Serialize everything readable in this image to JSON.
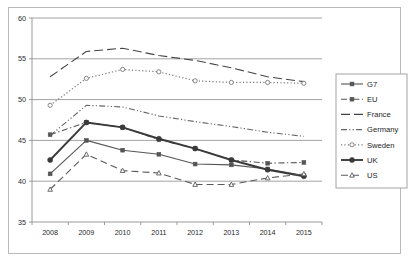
{
  "chart_data": {
    "type": "line",
    "title": "",
    "xlabel": "",
    "ylabel": "",
    "categories": [
      "2008",
      "2009",
      "2010",
      "2011",
      "2012",
      "2013",
      "2014",
      "2015"
    ],
    "x": [
      2008,
      2009,
      2010,
      2011,
      2012,
      2013,
      2014,
      2015
    ],
    "ylim": [
      35,
      60
    ],
    "yticks": [
      35,
      40,
      45,
      50,
      55,
      60
    ],
    "grid": "horizontal",
    "legend_position": "right",
    "series": [
      {
        "name": "G7",
        "marker": "square",
        "line": "solid",
        "color": "#555555",
        "values": [
          40.9,
          45.0,
          43.8,
          43.3,
          42.1,
          42.0,
          41.5,
          40.7
        ]
      },
      {
        "name": "EU",
        "marker": "square",
        "line": "dash-dot",
        "color": "#555555",
        "values": [
          45.7,
          47.2,
          46.6,
          45.1,
          44.0,
          42.6,
          42.2,
          42.3
        ]
      },
      {
        "name": "France",
        "marker": "none",
        "line": "long-dash",
        "color": "#444444",
        "values": [
          52.8,
          55.9,
          56.3,
          55.4,
          54.8,
          53.9,
          52.8,
          52.2
        ]
      },
      {
        "name": "Germany",
        "marker": "none",
        "line": "dash-dot-dot",
        "color": "#666666",
        "values": [
          45.6,
          49.3,
          49.1,
          48.0,
          47.3,
          46.7,
          46.0,
          45.5
        ]
      },
      {
        "name": "Sweden",
        "marker": "circle-open",
        "line": "dotted",
        "color": "#777777",
        "values": [
          49.3,
          52.6,
          53.7,
          53.4,
          52.3,
          52.1,
          52.1,
          52.0
        ]
      },
      {
        "name": "UK",
        "marker": "circle",
        "line": "solid-bold",
        "color": "#3a3a3a",
        "values": [
          42.6,
          47.2,
          46.6,
          45.2,
          44.0,
          42.6,
          41.4,
          40.6
        ]
      },
      {
        "name": "US",
        "marker": "triangle-open",
        "line": "dash",
        "color": "#5a5a5a",
        "values": [
          39.0,
          43.3,
          41.3,
          41.0,
          39.6,
          39.6,
          40.4,
          40.9
        ]
      }
    ]
  },
  "axes": {
    "y_tick_labels": [
      "60",
      "55",
      "50",
      "45",
      "40",
      "35"
    ],
    "x_tick_labels": [
      "2008",
      "2009",
      "2010",
      "2011",
      "2012",
      "2013",
      "2014",
      "2015"
    ]
  },
  "legend": {
    "entries": [
      {
        "label": "G7"
      },
      {
        "label": "EU"
      },
      {
        "label": "France"
      },
      {
        "label": "Germany"
      },
      {
        "label": "Sweden"
      },
      {
        "label": "UK"
      },
      {
        "label": "US"
      }
    ]
  },
  "colors": {
    "plot_border": "#8f8f8f",
    "gridline": "#8a8a8a",
    "frame": "#b9b9b9",
    "background": "#ffffff"
  }
}
